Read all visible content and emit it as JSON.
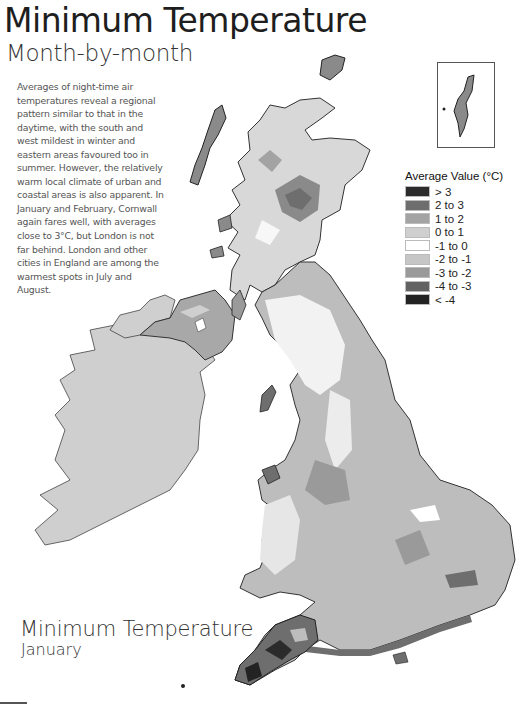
{
  "header": {
    "title": "Minimum Temperature",
    "subtitle": "Month-by-month"
  },
  "intro_text": "Averages of night-time air temperatures reveal a regional pattern similar to that in the daytime, with the south and west mildest in winter and eastern areas favoured too in summer. However, the relatively warm local climate of urban and coastal areas is also apparent. In January and February, Cornwall again fares well, with averages close to 3°C, but London is not far behind. London and other cities in England are among the warmest spots in July and August.",
  "legend": {
    "title": "Average Value (°C)",
    "items": [
      {
        "label": "> 3",
        "color": "#2b2b2b"
      },
      {
        "label": "2 to 3",
        "color": "#6e6e6e"
      },
      {
        "label": "1 to 2",
        "color": "#a3a3a3"
      },
      {
        "label": "0 to 1",
        "color": "#cfcfcf"
      },
      {
        "label": "-1 to 0",
        "color": "#ffffff"
      },
      {
        "label": "-2 to -1",
        "color": "#c6c6c6"
      },
      {
        "label": "-3 to -2",
        "color": "#9a9a9a"
      },
      {
        "label": "-4 to -3",
        "color": "#626262"
      },
      {
        "label": "< -4",
        "color": "#232323"
      }
    ]
  },
  "map": {
    "title": "Minimum Temperature",
    "subtitle": "January",
    "inset_label": "Shetland inset",
    "regions": [
      "Scotland",
      "Northern Ireland",
      "Ireland",
      "England",
      "Wales",
      "Cornwall"
    ]
  }
}
